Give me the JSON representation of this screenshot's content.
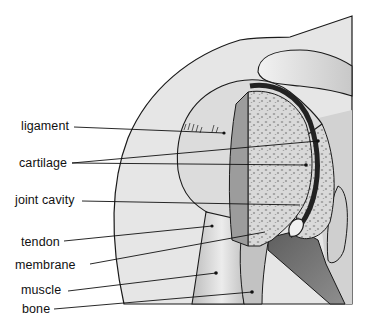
{
  "diagram": {
    "labels": [
      {
        "id": "ligament",
        "text": "ligament",
        "x": 21,
        "y": 120
      },
      {
        "id": "cartilage",
        "text": "cartilage",
        "x": 19,
        "y": 157
      },
      {
        "id": "joint-cavity",
        "text": "joint cavity",
        "x": 15,
        "y": 194
      },
      {
        "id": "tendon",
        "text": "tendon",
        "x": 21,
        "y": 236
      },
      {
        "id": "membrane",
        "text": "membrane",
        "x": 15,
        "y": 259
      },
      {
        "id": "muscle",
        "text": "muscle",
        "x": 21,
        "y": 284
      },
      {
        "id": "bone",
        "text": "bone",
        "x": 22,
        "y": 303
      }
    ],
    "colors": {
      "background": "#ffffff",
      "skin": "#e4e4e4",
      "outline": "#1a1a1a",
      "bone_light": "#d6d6d6",
      "bone_dark": "#8c8c8c",
      "cartilage_dark": "#2a2a2a",
      "muscle_dark": "#6e6e6e"
    }
  }
}
